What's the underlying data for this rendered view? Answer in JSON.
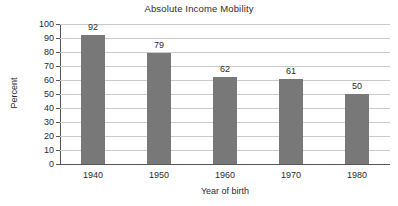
{
  "chart_data": {
    "type": "bar",
    "title": "Absolute Income Mobility",
    "xlabel": "Year of birth",
    "ylabel": "Percent",
    "categories": [
      "1940",
      "1950",
      "1960",
      "1970",
      "1980"
    ],
    "values": [
      92,
      79,
      62,
      61,
      50
    ],
    "value_labels": [
      "92",
      "79",
      "62",
      "61",
      "50"
    ],
    "ylim": [
      0,
      100
    ],
    "ytick_labels": [
      "0",
      "10",
      "20",
      "30",
      "40",
      "50",
      "60",
      "70",
      "80",
      "90",
      "100"
    ],
    "ytick_values": [
      0,
      10,
      20,
      30,
      40,
      50,
      60,
      70,
      80,
      90,
      100
    ],
    "grid": "horizontal",
    "legend": "none",
    "bar_color": "#787878",
    "gridline_color": "#c9c9c9",
    "axis_color": "#555555",
    "text_color": "#2b2b2b",
    "background_color": "#ffffff"
  }
}
